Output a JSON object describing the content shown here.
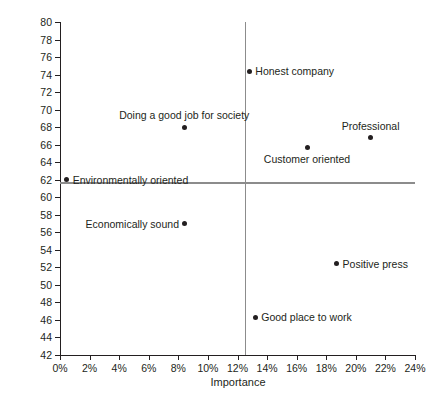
{
  "chart_data": {
    "type": "scatter",
    "title": "",
    "xlabel": "Importance",
    "ylabel": "Index",
    "xlim": [
      0,
      24
    ],
    "ylim": [
      42,
      80
    ],
    "grid": false,
    "legend": "none",
    "x_tick_labels": [
      "0%",
      "2%",
      "4%",
      "6%",
      "8%",
      "10%",
      "12%",
      "14%",
      "16%",
      "18%",
      "20%",
      "22%",
      "24%"
    ],
    "x_tick_values": [
      0,
      2,
      4,
      6,
      8,
      10,
      12,
      14,
      16,
      18,
      20,
      22,
      24
    ],
    "y_tick_labels": [
      "42",
      "44",
      "46",
      "48",
      "50",
      "52",
      "54",
      "56",
      "58",
      "60",
      "62",
      "64",
      "66",
      "68",
      "70",
      "72",
      "74",
      "76",
      "78",
      "80"
    ],
    "y_tick_values": [
      42,
      44,
      46,
      48,
      50,
      52,
      54,
      56,
      58,
      60,
      62,
      64,
      66,
      68,
      70,
      72,
      74,
      76,
      78,
      80
    ],
    "reference_lines": {
      "vertical_x": 12.5,
      "horizontal_y": 61.7,
      "color": "#8c8c8c"
    },
    "marker_color": "#231f20",
    "points": [
      {
        "label": "Environmentally oriented",
        "x": 0.45,
        "y": 62.0,
        "label_pos": "right"
      },
      {
        "label": "Doing a good job for society",
        "x": 8.4,
        "y": 68.0,
        "label_pos": "above"
      },
      {
        "label": "Economically sound",
        "x": 8.45,
        "y": 57.0,
        "label_pos": "left"
      },
      {
        "label": "Honest company",
        "x": 12.8,
        "y": 74.4,
        "label_pos": "right"
      },
      {
        "label": "Customer oriented",
        "x": 16.7,
        "y": 65.7,
        "label_pos": "below"
      },
      {
        "label": "Professional",
        "x": 21.0,
        "y": 66.8,
        "label_pos": "above"
      },
      {
        "label": "Positive press",
        "x": 18.7,
        "y": 52.4,
        "label_pos": "right"
      },
      {
        "label": "Good place to work",
        "x": 13.2,
        "y": 46.3,
        "label_pos": "right"
      }
    ]
  },
  "footer": {
    "note": ""
  }
}
